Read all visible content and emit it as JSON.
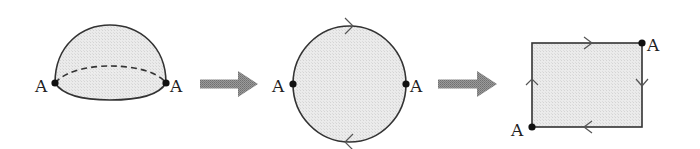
{
  "diagram": {
    "colors": {
      "fill": "#e6e6e6",
      "stroke": "#333333",
      "arrow": "#8a8a8a",
      "point": "#111111"
    },
    "stages": [
      {
        "name": "hemisphere",
        "points": [
          {
            "label": "A",
            "position": "left"
          },
          {
            "label": "A",
            "position": "right"
          }
        ],
        "equator_style": "dashed"
      },
      {
        "name": "disk",
        "points": [
          {
            "label": "A",
            "position": "left"
          },
          {
            "label": "A",
            "position": "right"
          }
        ],
        "edge_orientation": {
          "top": "right",
          "bottom": "left"
        }
      },
      {
        "name": "square",
        "points": [
          {
            "label": "A",
            "position": "top-right"
          },
          {
            "label": "A",
            "position": "bottom-left"
          }
        ],
        "edge_orientation": {
          "top": "right",
          "right": "down",
          "bottom": "left",
          "left": "up"
        }
      }
    ],
    "transitions": [
      {
        "from": "hemisphere",
        "to": "disk",
        "icon": "right-arrow"
      },
      {
        "from": "disk",
        "to": "square",
        "icon": "right-arrow"
      }
    ]
  }
}
